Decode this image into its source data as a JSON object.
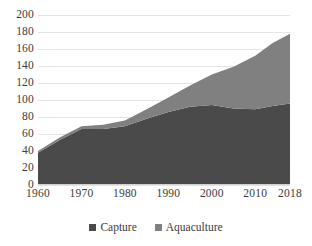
{
  "chart_data": {
    "type": "area",
    "stacked": true,
    "title": "",
    "subtitle": "",
    "xlabel": "",
    "ylabel": "",
    "xlim": [
      1960,
      2018
    ],
    "ylim": [
      0,
      200
    ],
    "ytick_step": 20,
    "grid": true,
    "legend_position": "bottom",
    "x": [
      1960,
      1965,
      1970,
      1975,
      1980,
      1985,
      1990,
      1995,
      2000,
      2005,
      2010,
      2014,
      2018
    ],
    "xtick_labels": [
      "1960",
      "1970",
      "1980",
      "1990",
      "2000",
      "2010",
      "2018"
    ],
    "xtick_values": [
      1960,
      1970,
      1980,
      1990,
      2000,
      2010,
      2018
    ],
    "ytick_labels": [
      "0",
      "20",
      "40",
      "60",
      "80",
      "100",
      "120",
      "140",
      "160",
      "180",
      "200"
    ],
    "ytick_values": [
      0,
      20,
      40,
      60,
      80,
      100,
      120,
      140,
      160,
      180,
      200
    ],
    "series": [
      {
        "name": "Capture",
        "color": "#4a4a4a",
        "values": [
          38,
          53,
          66,
          66,
          69,
          78,
          86,
          92,
          94,
          90,
          89,
          93,
          96
        ]
      },
      {
        "name": "Aquaculture",
        "color": "#808080",
        "values": [
          2,
          3,
          3,
          5,
          7,
          11,
          17,
          25,
          36,
          49,
          63,
          74,
          82
        ]
      }
    ],
    "totals": [
      40,
      56,
      69,
      71,
      76,
      89,
      103,
      117,
      130,
      139,
      152,
      167,
      178
    ],
    "colors": {
      "capture": "#4a4a4a",
      "aquaculture": "#808080",
      "gridline": "#e4e4e4",
      "text": "#3b3b3b",
      "background": "#ffffff"
    }
  },
  "legend": {
    "items": [
      {
        "label": "Capture",
        "color": "#4a4a4a",
        "marker": "square-marker"
      },
      {
        "label": "Aquaculture",
        "color": "#808080",
        "marker": "square-marker"
      }
    ]
  }
}
